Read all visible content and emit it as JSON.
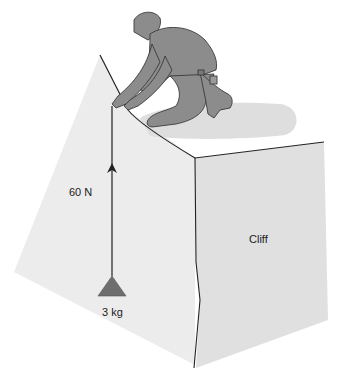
{
  "figure": {
    "caption_fragment": "",
    "labels": {
      "force": "60 N",
      "mass": "3 kg",
      "cliff": "Cliff"
    },
    "colors": {
      "background": "#ffffff",
      "left_face": "#ececec",
      "right_face": "#e2e2e2",
      "top_surface": "#ffffff",
      "shadow": "#dcdcdc",
      "figure_fill": "#8c8c8c",
      "figure_outline": "#3a3a3a",
      "rope": "#222222",
      "weight": "#6e6e6e",
      "edge": "#222222"
    }
  }
}
